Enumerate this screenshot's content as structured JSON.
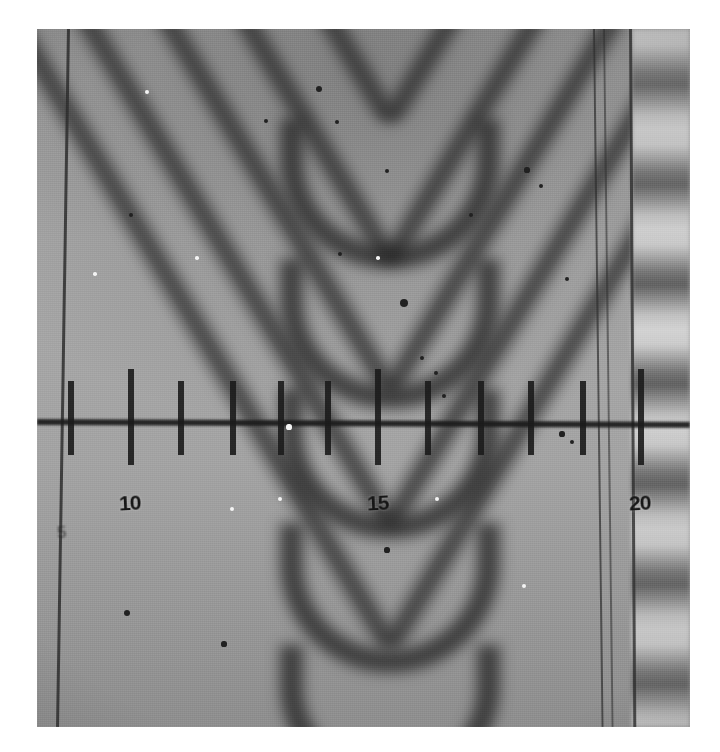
{
  "image": {
    "kind": "photomicrograph",
    "subject": "optical interference fringes with measuring scale overlay",
    "background_color": "#ffffff",
    "plate": {
      "x": 37,
      "y": 29,
      "width": 653,
      "height": 698,
      "base_gray": "#9b9b9b"
    }
  },
  "scale": {
    "name": "measuring-reticle",
    "axis_y": 390,
    "axis_color": "#1d1d1d",
    "tick_color": "#1d1d1d",
    "ticks": [
      {
        "x": 31,
        "kind": "minor",
        "label": null
      },
      {
        "x": 91,
        "kind": "major",
        "label": "10"
      },
      {
        "x": 141,
        "kind": "minor",
        "label": null
      },
      {
        "x": 193,
        "kind": "minor",
        "label": null
      },
      {
        "x": 241,
        "kind": "minor",
        "label": null
      },
      {
        "x": 288,
        "kind": "minor",
        "label": null
      },
      {
        "x": 338,
        "kind": "major",
        "label": "15"
      },
      {
        "x": 388,
        "kind": "minor",
        "label": null
      },
      {
        "x": 441,
        "kind": "minor",
        "label": null
      },
      {
        "x": 491,
        "kind": "minor",
        "label": null
      },
      {
        "x": 543,
        "kind": "minor",
        "label": null
      },
      {
        "x": 601,
        "kind": "major",
        "label": "20"
      }
    ],
    "labels": [
      {
        "text": "5",
        "x": 20,
        "y": 494,
        "faint": true
      },
      {
        "text": "10",
        "x": 82,
        "y": 462,
        "faint": false
      },
      {
        "text": "15",
        "x": 330,
        "y": 462,
        "faint": false
      },
      {
        "text": "20",
        "x": 592,
        "y": 462,
        "faint": false
      }
    ]
  },
  "fringes": {
    "pattern": "nested parabolic (V-shaped) interference fringes",
    "apex_x": 353,
    "dark_fringe_apex_y": [
      96,
      236,
      366,
      500,
      622
    ],
    "arm_tilt_degrees": 31,
    "right_strip": {
      "x": 595,
      "width": 58,
      "pattern": "horizontal straight fringes",
      "period_px": 100
    }
  },
  "glass_edges": [
    {
      "name": "left-edge",
      "x": 30,
      "tilt": 0.9
    },
    {
      "name": "inner-right-edge-a",
      "x": 556,
      "tilt": -0.7
    },
    {
      "name": "inner-right-edge-b",
      "x": 566,
      "tilt": -0.7
    },
    {
      "name": "right-edge",
      "x": 592,
      "tilt": -0.35
    }
  ],
  "specks": [
    {
      "x": 282,
      "y": 60,
      "r": 3.0,
      "tone": "dark"
    },
    {
      "x": 229,
      "y": 92,
      "r": 2.4,
      "tone": "dark"
    },
    {
      "x": 300,
      "y": 93,
      "r": 2.2,
      "tone": "dark"
    },
    {
      "x": 350,
      "y": 142,
      "r": 2.0,
      "tone": "dark"
    },
    {
      "x": 490,
      "y": 141,
      "r": 2.6,
      "tone": "dark"
    },
    {
      "x": 504,
      "y": 157,
      "r": 2.2,
      "tone": "dark"
    },
    {
      "x": 303,
      "y": 225,
      "r": 2.2,
      "tone": "dark"
    },
    {
      "x": 367,
      "y": 274,
      "r": 4.2,
      "tone": "dark"
    },
    {
      "x": 385,
      "y": 329,
      "r": 2.4,
      "tone": "dark"
    },
    {
      "x": 399,
      "y": 344,
      "r": 2.0,
      "tone": "dark"
    },
    {
      "x": 390,
      "y": 360,
      "r": 2.4,
      "tone": "dark"
    },
    {
      "x": 407,
      "y": 367,
      "r": 2.0,
      "tone": "dark"
    },
    {
      "x": 434,
      "y": 186,
      "r": 2.0,
      "tone": "dark"
    },
    {
      "x": 530,
      "y": 250,
      "r": 2.2,
      "tone": "dark"
    },
    {
      "x": 525,
      "y": 405,
      "r": 2.6,
      "tone": "dark"
    },
    {
      "x": 535,
      "y": 413,
      "r": 2.4,
      "tone": "dark"
    },
    {
      "x": 350,
      "y": 521,
      "r": 2.6,
      "tone": "dark"
    },
    {
      "x": 90,
      "y": 584,
      "r": 3.0,
      "tone": "dark"
    },
    {
      "x": 187,
      "y": 615,
      "r": 2.6,
      "tone": "dark"
    },
    {
      "x": 253,
      "y": 742,
      "r": 2.4,
      "tone": "dark"
    },
    {
      "x": 94,
      "y": 186,
      "r": 2.0,
      "tone": "dark"
    },
    {
      "x": 110,
      "y": 63,
      "r": 2.0,
      "tone": "light"
    },
    {
      "x": 58,
      "y": 245,
      "r": 1.8,
      "tone": "light"
    },
    {
      "x": 160,
      "y": 229,
      "r": 1.8,
      "tone": "light"
    },
    {
      "x": 341,
      "y": 229,
      "r": 1.8,
      "tone": "light"
    },
    {
      "x": 195,
      "y": 480,
      "r": 2.0,
      "tone": "light"
    },
    {
      "x": 243,
      "y": 470,
      "r": 2.2,
      "tone": "light"
    },
    {
      "x": 252,
      "y": 398,
      "r": 2.6,
      "tone": "light"
    },
    {
      "x": 400,
      "y": 470,
      "r": 2.0,
      "tone": "light"
    },
    {
      "x": 487,
      "y": 557,
      "r": 2.0,
      "tone": "light"
    }
  ]
}
